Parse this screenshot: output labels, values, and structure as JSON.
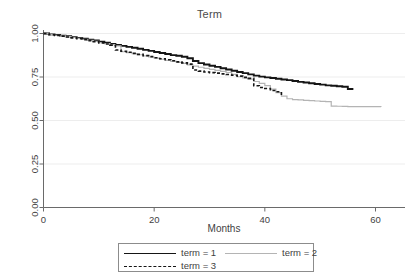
{
  "chart_data": {
    "type": "line",
    "title": "Term",
    "xlabel": "Months",
    "ylabel": "",
    "xlim": [
      0,
      62
    ],
    "ylim": [
      0,
      1
    ],
    "grid": true,
    "grid_axis": "y",
    "legend_position": "bottom",
    "xticks": [
      0,
      20,
      40,
      60
    ],
    "xtick_labels": [
      "0",
      "20",
      "40",
      "60"
    ],
    "yticks": [
      0.0,
      0.25,
      0.5,
      0.75,
      1.0
    ],
    "ytick_labels": [
      "0.00",
      "0.25",
      "0.50",
      "0.75",
      "1.00"
    ],
    "series": [
      {
        "name": "term = 1",
        "legend_label": "term = 1",
        "color": "#151515",
        "style": "solid",
        "width": 1.9,
        "points": [
          [
            0,
            1.0
          ],
          [
            1,
            0.995
          ],
          [
            2,
            0.992
          ],
          [
            3,
            0.988
          ],
          [
            4,
            0.984
          ],
          [
            5,
            0.979
          ],
          [
            6,
            0.975
          ],
          [
            7,
            0.97
          ],
          [
            8,
            0.965
          ],
          [
            9,
            0.96
          ],
          [
            10,
            0.953
          ],
          [
            11,
            0.947
          ],
          [
            12,
            0.94
          ],
          [
            13,
            0.934
          ],
          [
            14,
            0.929
          ],
          [
            15,
            0.923
          ],
          [
            16,
            0.918
          ],
          [
            17,
            0.912
          ],
          [
            18,
            0.906
          ],
          [
            19,
            0.9
          ],
          [
            20,
            0.894
          ],
          [
            21,
            0.888
          ],
          [
            22,
            0.882
          ],
          [
            23,
            0.876
          ],
          [
            24,
            0.872
          ],
          [
            25,
            0.866
          ],
          [
            26,
            0.858
          ],
          [
            27,
            0.842
          ],
          [
            28,
            0.83
          ],
          [
            29,
            0.822
          ],
          [
            30,
            0.815
          ],
          [
            31,
            0.808
          ],
          [
            32,
            0.8
          ],
          [
            33,
            0.793
          ],
          [
            34,
            0.786
          ],
          [
            35,
            0.779
          ],
          [
            36,
            0.772
          ],
          [
            37,
            0.765
          ],
          [
            38,
            0.758
          ],
          [
            39,
            0.752
          ],
          [
            40,
            0.748
          ],
          [
            41,
            0.744
          ],
          [
            42,
            0.74
          ],
          [
            43,
            0.736
          ],
          [
            44,
            0.732
          ],
          [
            45,
            0.727
          ],
          [
            46,
            0.722
          ],
          [
            47,
            0.718
          ],
          [
            48,
            0.714
          ],
          [
            49,
            0.71
          ],
          [
            50,
            0.706
          ],
          [
            51,
            0.702
          ],
          [
            52,
            0.7
          ],
          [
            53,
            0.697
          ],
          [
            54,
            0.694
          ],
          [
            55,
            0.681
          ],
          [
            56,
            0.681
          ]
        ]
      },
      {
        "name": "term = 2",
        "legend_label": "term = 2",
        "color": "#b4b4b4",
        "style": "solid",
        "width": 1.2,
        "points": [
          [
            0,
            1.0
          ],
          [
            1,
            0.994
          ],
          [
            2,
            0.99
          ],
          [
            3,
            0.986
          ],
          [
            4,
            0.982
          ],
          [
            5,
            0.977
          ],
          [
            6,
            0.972
          ],
          [
            7,
            0.967
          ],
          [
            8,
            0.961
          ],
          [
            9,
            0.955
          ],
          [
            10,
            0.948
          ],
          [
            11,
            0.942
          ],
          [
            12,
            0.936
          ],
          [
            13,
            0.929
          ],
          [
            14,
            0.895
          ],
          [
            15,
            0.89
          ],
          [
            16,
            0.884
          ],
          [
            17,
            0.878
          ],
          [
            18,
            0.871
          ],
          [
            19,
            0.865
          ],
          [
            20,
            0.858
          ],
          [
            21,
            0.852
          ],
          [
            22,
            0.846
          ],
          [
            23,
            0.84
          ],
          [
            24,
            0.834
          ],
          [
            25,
            0.828
          ],
          [
            26,
            0.82
          ],
          [
            27,
            0.812
          ],
          [
            28,
            0.806
          ],
          [
            29,
            0.8
          ],
          [
            30,
            0.794
          ],
          [
            31,
            0.788
          ],
          [
            32,
            0.782
          ],
          [
            33,
            0.776
          ],
          [
            34,
            0.765
          ],
          [
            35,
            0.752
          ],
          [
            36,
            0.745
          ],
          [
            37,
            0.738
          ],
          [
            38,
            0.724
          ],
          [
            39,
            0.713
          ],
          [
            40,
            0.7
          ],
          [
            41,
            0.68
          ],
          [
            42,
            0.66
          ],
          [
            43,
            0.64
          ],
          [
            44,
            0.625
          ],
          [
            45,
            0.62
          ],
          [
            46,
            0.618
          ],
          [
            47,
            0.616
          ],
          [
            48,
            0.614
          ],
          [
            49,
            0.612
          ],
          [
            50,
            0.61
          ],
          [
            51,
            0.608
          ],
          [
            52,
            0.583
          ],
          [
            53,
            0.582
          ],
          [
            54,
            0.581
          ],
          [
            55,
            0.58
          ],
          [
            56,
            0.58
          ],
          [
            57,
            0.58
          ],
          [
            58,
            0.58
          ],
          [
            59,
            0.58
          ],
          [
            60,
            0.58
          ],
          [
            61,
            0.579
          ]
        ]
      },
      {
        "name": "term = 3",
        "legend_label": "term = 3",
        "color": "#151515",
        "style": "dashed",
        "width": 1.6,
        "points": [
          [
            0,
            1.0
          ],
          [
            1,
            0.993
          ],
          [
            2,
            0.989
          ],
          [
            3,
            0.985
          ],
          [
            4,
            0.98
          ],
          [
            5,
            0.975
          ],
          [
            6,
            0.97
          ],
          [
            7,
            0.965
          ],
          [
            8,
            0.959
          ],
          [
            9,
            0.953
          ],
          [
            10,
            0.946
          ],
          [
            11,
            0.94
          ],
          [
            12,
            0.933
          ],
          [
            13,
            0.905
          ],
          [
            14,
            0.898
          ],
          [
            15,
            0.892
          ],
          [
            16,
            0.886
          ],
          [
            17,
            0.88
          ],
          [
            18,
            0.873
          ],
          [
            19,
            0.867
          ],
          [
            20,
            0.861
          ],
          [
            21,
            0.855
          ],
          [
            22,
            0.849
          ],
          [
            23,
            0.843
          ],
          [
            24,
            0.837
          ],
          [
            25,
            0.831
          ],
          [
            26,
            0.824
          ],
          [
            27,
            0.79
          ],
          [
            28,
            0.784
          ],
          [
            29,
            0.779
          ],
          [
            30,
            0.775
          ],
          [
            31,
            0.772
          ],
          [
            32,
            0.768
          ],
          [
            33,
            0.764
          ],
          [
            34,
            0.76
          ],
          [
            35,
            0.755
          ],
          [
            36,
            0.748
          ],
          [
            37,
            0.742
          ],
          [
            38,
            0.7
          ],
          [
            39,
            0.69
          ],
          [
            40,
            0.684
          ],
          [
            41,
            0.672
          ],
          [
            42,
            0.665
          ],
          [
            43,
            0.643
          ]
        ]
      }
    ]
  }
}
